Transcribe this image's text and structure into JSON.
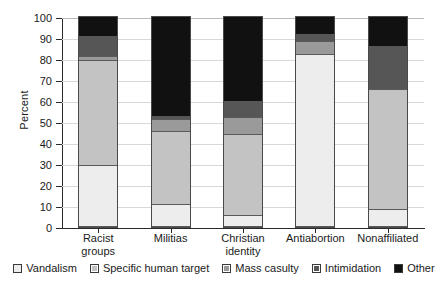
{
  "chart_data": {
    "type": "bar",
    "subtype": "stacked-bar-100",
    "title": "",
    "xlabel": "",
    "ylabel": "Percent",
    "ylim": [
      0,
      100
    ],
    "ytick_step": 10,
    "ytick_labels": [
      "100",
      "90",
      "80",
      "70",
      "60",
      "50",
      "40",
      "30",
      "20",
      "10",
      "0"
    ],
    "grid": true,
    "legend_position": "bottom",
    "categories": [
      "Racist groups",
      "Militias",
      "Christian identity",
      "Antiabortion",
      "Nonaffiliated"
    ],
    "category_lines": [
      [
        "Racist",
        "groups"
      ],
      [
        "Militias",
        ""
      ],
      [
        "Christian",
        "identity"
      ],
      [
        "Antiabortion",
        ""
      ],
      [
        "Nonaffiliated",
        ""
      ]
    ],
    "series": [
      {
        "name": "Vandalism",
        "color": "#ededed",
        "values": [
          29,
          10.5,
          5,
          82,
          8
        ]
      },
      {
        "name": "Specific human target",
        "color": "#c3c3c3",
        "values": [
          50,
          34.5,
          39,
          0,
          57
        ]
      },
      {
        "name": "Mass casulty",
        "color": "#9a9a9a",
        "values": [
          2,
          6,
          8,
          6,
          0
        ]
      },
      {
        "name": "Intimidation",
        "color": "#565656",
        "values": [
          10,
          2,
          8,
          4,
          21
        ]
      },
      {
        "name": "Other",
        "color": "#111111",
        "values": [
          9,
          47,
          40,
          8,
          14
        ]
      }
    ],
    "cumulative_tops": [
      [
        29,
        79,
        81,
        91,
        100
      ],
      [
        10.5,
        45,
        51,
        53,
        100
      ],
      [
        5,
        44,
        52,
        60,
        100
      ],
      [
        82,
        82,
        88,
        92,
        100
      ],
      [
        8,
        65,
        65,
        86,
        100
      ]
    ]
  },
  "legend": {
    "items": [
      {
        "label": "Vandalism"
      },
      {
        "label": "Specific human target"
      },
      {
        "label": "Mass casulty"
      },
      {
        "label": "Intimidation"
      },
      {
        "label": "Other"
      }
    ]
  }
}
